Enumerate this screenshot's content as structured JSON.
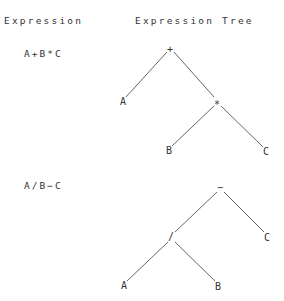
{
  "headers": {
    "expression": "Expression",
    "tree": "Expression Tree"
  },
  "examples": [
    {
      "expression": "A+B*C",
      "nodes": {
        "root": {
          "label": "+",
          "x": 170,
          "y": 53
        },
        "a": {
          "label": "A",
          "x": 123,
          "y": 105
        },
        "op": {
          "label": "*",
          "x": 217,
          "y": 106
        },
        "b": {
          "label": "B",
          "x": 169,
          "y": 154
        },
        "c": {
          "label": "C",
          "x": 266,
          "y": 155
        }
      }
    },
    {
      "expression": "A/B−C",
      "nodes": {
        "root": {
          "label": "−",
          "x": 220,
          "y": 191
        },
        "op": {
          "label": "/",
          "x": 171,
          "y": 240
        },
        "c": {
          "label": "C",
          "x": 267,
          "y": 241
        },
        "a": {
          "label": "A",
          "x": 124,
          "y": 289
        },
        "b": {
          "label": "B",
          "x": 218,
          "y": 290
        }
      }
    }
  ]
}
